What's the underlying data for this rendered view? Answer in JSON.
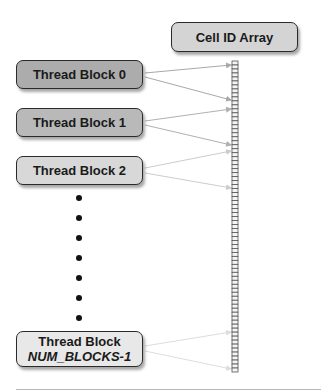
{
  "diagram": {
    "array_label": "Cell ID Array",
    "blocks": [
      {
        "label": "Thread Block 0",
        "fill": "#acacac"
      },
      {
        "label": "Thread Block 1",
        "fill": "#b9b9b9"
      },
      {
        "label": "Thread Block 2",
        "fill": "#d8d8d8"
      },
      {
        "label_line1": "Thread Block",
        "label_line2": "NUM_BLOCKS-1",
        "fill": "#e8e8e8"
      }
    ],
    "ellipsis_dots": 7,
    "array": {
      "cell_count": 78,
      "color": "#555555"
    },
    "arrow_colors": [
      "#a8a8a8",
      "#b0b0b0",
      "#cccccc",
      "#dddddd"
    ]
  }
}
